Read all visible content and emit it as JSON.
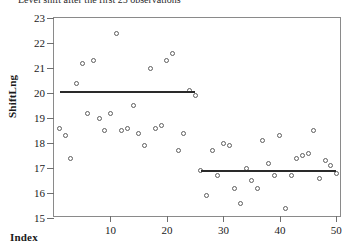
{
  "chart_data": {
    "type": "scatter",
    "title": "Level shift after the first 25 observations",
    "xlabel": "Index",
    "ylabel": "ShiftLng",
    "xlim": [
      0,
      51
    ],
    "ylim": [
      15,
      23
    ],
    "grid": false,
    "legend": null,
    "xticks": [
      10,
      20,
      30,
      40,
      50
    ],
    "yticks": [
      15,
      16,
      17,
      18,
      19,
      20,
      21,
      22,
      23
    ],
    "marker": "open-circle",
    "x": [
      1,
      2,
      3,
      4,
      5,
      6,
      7,
      8,
      9,
      10,
      11,
      12,
      13,
      14,
      15,
      16,
      17,
      18,
      19,
      20,
      21,
      22,
      23,
      24,
      25,
      26,
      27,
      28,
      29,
      30,
      31,
      32,
      33,
      34,
      35,
      36,
      37,
      38,
      39,
      40,
      41,
      42,
      43,
      44,
      45,
      46,
      47,
      48,
      49,
      50
    ],
    "values": [
      18.6,
      18.3,
      17.4,
      20.4,
      21.2,
      19.2,
      21.3,
      19.0,
      18.5,
      19.2,
      22.4,
      18.5,
      18.6,
      19.5,
      18.4,
      17.9,
      21.0,
      18.6,
      18.7,
      21.3,
      21.6,
      17.7,
      18.4,
      20.1,
      19.9,
      16.9,
      15.9,
      17.7,
      16.7,
      18.0,
      17.9,
      16.2,
      15.6,
      17.0,
      16.5,
      16.2,
      18.1,
      17.2,
      16.7,
      18.3,
      15.4,
      16.7,
      17.4,
      17.5,
      17.6,
      18.5,
      16.6,
      17.3,
      17.1,
      16.8
    ],
    "annotations": [
      {
        "type": "mean-line",
        "label": "segment-1-mean",
        "x_start": 1,
        "x_end": 25,
        "y": 20.05
      },
      {
        "type": "mean-line",
        "label": "segment-2-mean",
        "x_start": 26,
        "x_end": 50,
        "y": 16.9
      }
    ]
  }
}
